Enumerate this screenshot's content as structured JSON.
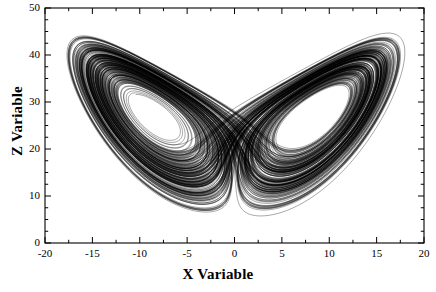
{
  "chart_data": {
    "type": "line",
    "title": "",
    "xlabel": "X Variable",
    "ylabel": "Z Variable",
    "xlim": [
      -20,
      20
    ],
    "ylim": [
      0,
      50
    ],
    "xticks": [
      -20,
      -15,
      -10,
      -5,
      0,
      5,
      10,
      15,
      20
    ],
    "xtick_labels": [
      "-20",
      "-15",
      "-10",
      "-5",
      "0",
      "5",
      "10",
      "15",
      "20"
    ],
    "yticks": [
      0,
      10,
      20,
      30,
      40,
      50
    ],
    "ytick_labels": [
      "0",
      "10",
      "20",
      "30",
      "40",
      "50"
    ],
    "x_minor_per_major": 2,
    "y_minor_per_major": 4,
    "grid": false,
    "legend": null,
    "frame": "box",
    "tick_direction": "in",
    "ticks_on_all_sides": true,
    "line_color": "#000000",
    "line_width": 0.35,
    "background_color": "#ffffff",
    "system": {
      "name": "Lorenz",
      "equations": [
        "dx/dt = sigma*(y-x)",
        "dy/dt = x*(rho-z)-y",
        "dz/dt = x*y-beta*z"
      ],
      "sigma": 10,
      "rho": 28,
      "beta": 2.6666666667,
      "initial_state": [
        0.1,
        0.0,
        12.0
      ],
      "dt": 0.0045,
      "steps": 62000,
      "skip_transient": 300
    },
    "features": {
      "left_lobe_center": {
        "x": -8.8,
        "z": 27
      },
      "right_lobe_center": {
        "x": 8.8,
        "z": 27
      },
      "x_range_observed": [
        -18.5,
        18.5
      ],
      "z_range_observed": [
        3.2,
        47.5
      ],
      "lower_cusp": {
        "x": 0,
        "z": 3.3
      }
    }
  }
}
